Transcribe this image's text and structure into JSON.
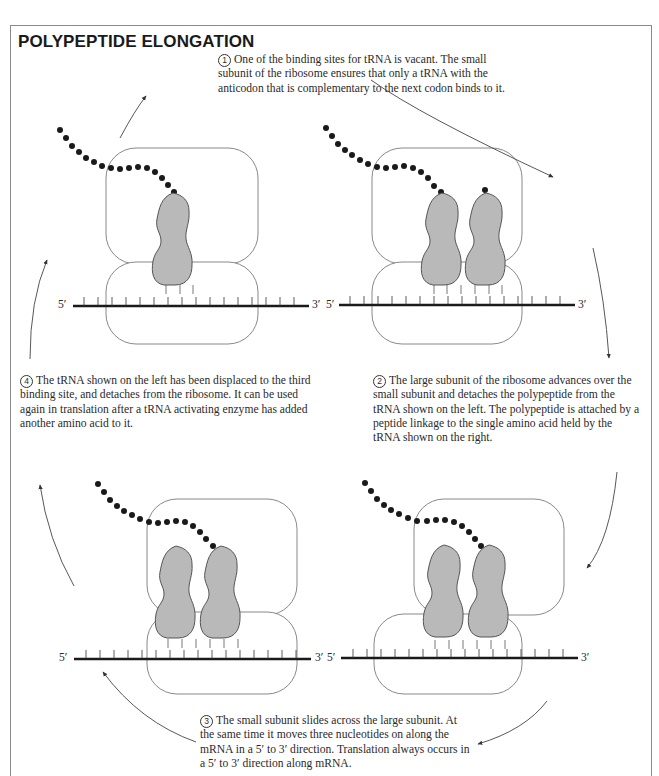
{
  "figure": {
    "title": "POLYPEPTIDE ELONGATION",
    "steps": [
      {
        "number": "1",
        "text": "One of the binding sites for tRNA is vacant. The small subunit of the ribosome ensures that only a tRNA with the anticodon that is complementary to the next codon binds to it."
      },
      {
        "number": "2",
        "text": "The large subunit of the ribosome advances over the small subunit and detaches the polypeptide from the tRNA shown on the left. The polypeptide is attached by a peptide linkage to the single amino acid held by the tRNA shown on the right."
      },
      {
        "number": "3",
        "text": "The small subunit slides across the large subunit. At the same time it moves three nucleotides on along the mRNA in a 5′ to 3′ direction. Translation always occurs in a 5′ to 3′ direction along mRNA."
      },
      {
        "number": "4",
        "text": "The tRNA shown on the left has been displaced to the third binding site, and detaches from the ribosome. It can be used again in translation after a tRNA activating enzyme has added another amino acid to it."
      }
    ],
    "panels": [
      {
        "id": "top-left",
        "mrna_5_label": "5′",
        "mrna_3_label": "3′",
        "trna_count": 1
      },
      {
        "id": "top-right",
        "mrna_5_label": "5′",
        "mrna_3_label": "3′",
        "trna_count": 2
      },
      {
        "id": "bottom-left",
        "mrna_5_label": "5′",
        "mrna_3_label": "3′",
        "trna_count": 2
      },
      {
        "id": "bottom-right",
        "mrna_5_label": "5′",
        "mrna_3_label": "3′",
        "trna_count": 2
      }
    ],
    "colors": {
      "border": "#8a8a8a",
      "ribosome_outline": "#7a7a7a",
      "trna_fill": "#b9b9b9",
      "trna_outline": "#555555",
      "amino_acid": "#1a1a1a",
      "mrna": "#1a1a1a"
    }
  }
}
